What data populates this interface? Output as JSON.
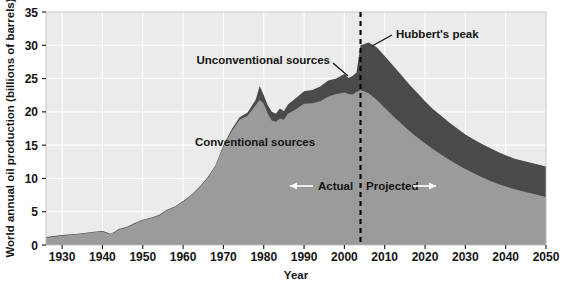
{
  "chart_data": {
    "type": "area",
    "title": "",
    "subtitle": "",
    "xlabel": "Year",
    "ylabel": "World annual oil production (billions of barrels)",
    "xlim": [
      1926,
      2050
    ],
    "ylim": [
      0,
      35
    ],
    "grid": true,
    "stacked": true,
    "legend_position": "inline-annotations",
    "xticks": [
      1930,
      1940,
      1950,
      1960,
      1970,
      1980,
      1990,
      2000,
      2010,
      2020,
      2030,
      2040,
      2050
    ],
    "xtick_labels": [
      "1930",
      "1940",
      "1950",
      "1960",
      "1970",
      "1980",
      "1990",
      "2000",
      "2010",
      "2020",
      "2030",
      "2040",
      "2050"
    ],
    "yticks": [
      0,
      5,
      10,
      15,
      20,
      25,
      30,
      35
    ],
    "ytick_labels": [
      "0",
      "5",
      "10",
      "15",
      "20",
      "25",
      "30",
      "35"
    ],
    "x": [
      1926,
      1930,
      1934,
      1938,
      1940,
      1941,
      1942,
      1943,
      1944,
      1946,
      1948,
      1950,
      1952,
      1954,
      1956,
      1958,
      1960,
      1962,
      1964,
      1966,
      1968,
      1970,
      1972,
      1974,
      1976,
      1978,
      1979,
      1980,
      1981,
      1982,
      1983,
      1984,
      1985,
      1986,
      1988,
      1990,
      1992,
      1994,
      1996,
      1998,
      2000,
      2001,
      2002,
      2003,
      2004,
      2006,
      2008,
      2010,
      2012,
      2014,
      2016,
      2018,
      2020,
      2022,
      2024,
      2026,
      2028,
      2030,
      2032,
      2034,
      2036,
      2038,
      2040,
      2042,
      2044,
      2046,
      2048,
      2050
    ],
    "series": [
      {
        "name": "Conventional sources",
        "color": "#9b9b9b",
        "values": [
          1.1,
          1.4,
          1.6,
          1.9,
          2.0,
          1.8,
          1.6,
          1.9,
          2.3,
          2.6,
          3.2,
          3.7,
          4.0,
          4.4,
          5.2,
          5.7,
          6.5,
          7.4,
          8.6,
          10.0,
          11.8,
          14.8,
          17.0,
          18.8,
          19.4,
          21.0,
          21.8,
          21.2,
          19.7,
          18.7,
          18.5,
          19.0,
          18.8,
          19.7,
          20.4,
          21.2,
          21.3,
          21.6,
          22.3,
          22.7,
          22.9,
          22.7,
          22.6,
          23.0,
          23.3,
          22.8,
          21.8,
          20.6,
          19.4,
          18.3,
          17.2,
          16.2,
          15.3,
          14.4,
          13.6,
          12.8,
          12.1,
          11.4,
          10.8,
          10.2,
          9.7,
          9.2,
          8.8,
          8.4,
          8.1,
          7.8,
          7.5,
          7.2
        ]
      },
      {
        "name": "Unconventional sources",
        "color": "#4a4a4a",
        "values": [
          0.1,
          0.1,
          0.1,
          0.1,
          0.1,
          0.1,
          0.1,
          0.1,
          0.1,
          0.1,
          0.1,
          0.1,
          0.1,
          0.1,
          0.1,
          0.1,
          0.1,
          0.1,
          0.1,
          0.1,
          0.1,
          0.2,
          0.3,
          0.4,
          0.5,
          0.8,
          2.1,
          1.3,
          1.3,
          1.3,
          1.2,
          1.5,
          1.3,
          1.4,
          1.7,
          1.9,
          2.0,
          2.2,
          2.4,
          2.3,
          2.8,
          2.4,
          2.8,
          2.9,
          6.7,
          7.6,
          7.9,
          7.8,
          7.6,
          7.3,
          7.0,
          6.7,
          6.3,
          6.0,
          5.8,
          5.6,
          5.4,
          5.2,
          5.1,
          5.0,
          4.9,
          4.8,
          4.7,
          4.6,
          4.6,
          4.6,
          4.6,
          4.6
        ]
      }
    ],
    "annotations": [
      {
        "id": "hubberts-peak",
        "text": "Hubbert's peak",
        "x": 2016,
        "y": 31.6
      },
      {
        "id": "unconventional-sources",
        "text": "Unconventional sources",
        "x": 1986,
        "y": 27.5
      },
      {
        "id": "conventional-sources",
        "text": "Conventional sources",
        "x": 1978,
        "y": 12.7
      },
      {
        "id": "actual",
        "text": "Actual",
        "x": 1997,
        "y": 9.1
      },
      {
        "id": "projected",
        "text": "Projected",
        "x": 2013,
        "y": 9.1
      }
    ],
    "divider": {
      "label": "present-day divider",
      "x": 2004,
      "style": "dashed"
    },
    "colors": {
      "plot_background": "#ebebeb",
      "grid": "#ffffff",
      "conventional": "#9b9b9b",
      "unconventional": "#4a4a4a",
      "axis_text": "#141414",
      "divider": "#000000"
    }
  },
  "axis": {
    "x_title": "Year",
    "y_title": "World annual oil production (billions of barrels)"
  },
  "labels": {
    "hubberts_peak": "Hubbert's peak",
    "unconventional_sources": "Unconventional sources",
    "conventional_sources": "Conventional sources",
    "actual": "Actual",
    "projected": "Projected"
  }
}
